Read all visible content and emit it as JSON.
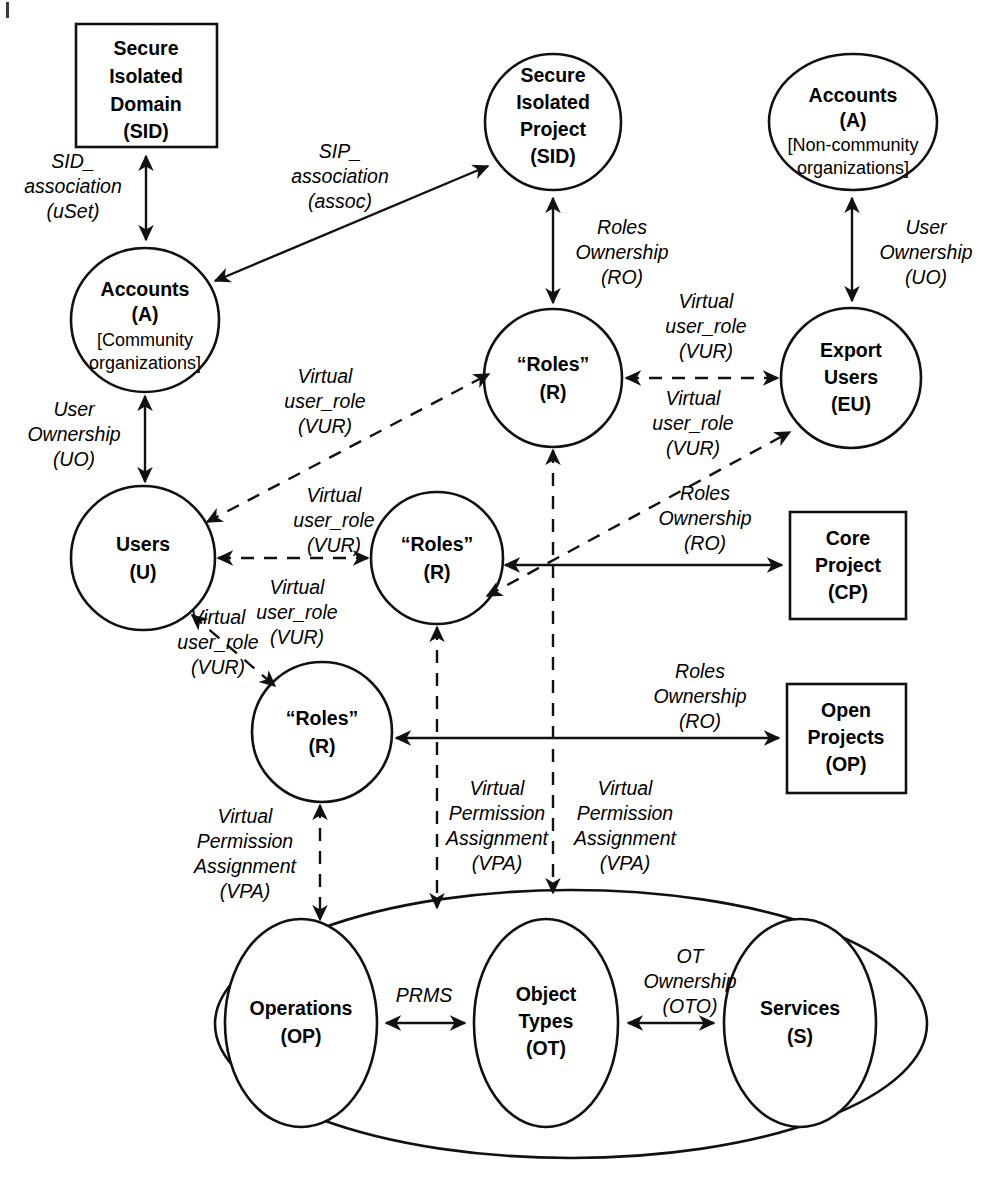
{
  "diagram": {
    "stroke_color": "#111111",
    "background_color": "#ffffff",
    "nodes": [
      {
        "id": "sid_box",
        "shape": "rect",
        "lines": [
          "Secure",
          "Isolated",
          "Domain",
          "(SID)"
        ]
      },
      {
        "id": "sip_circle",
        "shape": "circle",
        "lines": [
          "Secure",
          "Isolated",
          "Project",
          "(SID)"
        ]
      },
      {
        "id": "accounts_non",
        "shape": "ellipse",
        "lines": [
          "Accounts",
          "(A)"
        ],
        "sublines": [
          "[Non-community",
          "organizations]"
        ]
      },
      {
        "id": "accounts_comm",
        "shape": "ellipse",
        "lines": [
          "Accounts",
          "(A)"
        ],
        "sublines": [
          "[Community",
          "organizations]"
        ]
      },
      {
        "id": "roles_top",
        "shape": "circle",
        "lines": [
          "“Roles”",
          "(R)"
        ]
      },
      {
        "id": "export_users",
        "shape": "circle",
        "lines": [
          "Export",
          "Users",
          "(EU)"
        ]
      },
      {
        "id": "users",
        "shape": "circle",
        "lines": [
          "Users",
          "(U)"
        ]
      },
      {
        "id": "roles_mid",
        "shape": "circle",
        "lines": [
          "“Roles”",
          "(R)"
        ]
      },
      {
        "id": "core_project",
        "shape": "rect",
        "lines": [
          "Core",
          "Project",
          "(CP)"
        ]
      },
      {
        "id": "roles_bottom",
        "shape": "circle",
        "lines": [
          "“Roles”",
          "(R)"
        ]
      },
      {
        "id": "open_projects",
        "shape": "rect",
        "lines": [
          "Open",
          "Projects",
          "(OP)"
        ]
      },
      {
        "id": "operations",
        "shape": "ellipse",
        "lines": [
          "Operations",
          "(OP)"
        ]
      },
      {
        "id": "object_types",
        "shape": "ellipse",
        "lines": [
          "Object",
          "Types",
          "(OT)"
        ]
      },
      {
        "id": "services",
        "shape": "ellipse",
        "lines": [
          "Services",
          "(S)"
        ]
      },
      {
        "id": "outer_group",
        "shape": "ellipse",
        "lines": []
      }
    ],
    "edge_labels": [
      {
        "id": "sid_assoc",
        "lines": [
          "SID_",
          "association",
          "(uSet)"
        ]
      },
      {
        "id": "sip_assoc",
        "lines": [
          "SIP_",
          "association",
          "(assoc)"
        ]
      },
      {
        "id": "ro_sip",
        "lines": [
          "Roles",
          "Ownership",
          "(RO)"
        ]
      },
      {
        "id": "uo_non",
        "lines": [
          "User",
          "Ownership",
          "(UO)"
        ]
      },
      {
        "id": "vur_r_eu",
        "lines": [
          "Virtual",
          "user_role",
          "(VUR)"
        ]
      },
      {
        "id": "vur_u_rtop",
        "lines": [
          "Virtual",
          "user_role",
          "(VUR)"
        ]
      },
      {
        "id": "uo_comm",
        "lines": [
          "User",
          "Ownership",
          "(UO)"
        ]
      },
      {
        "id": "vur_rmid_eu",
        "lines": [
          "Virtual",
          "user_role",
          "(VUR)"
        ]
      },
      {
        "id": "vur_rmid_u",
        "lines": [
          "Virtual",
          "user_role",
          "(VUR)"
        ]
      },
      {
        "id": "vur_u_rmid",
        "lines": [
          "Virtual",
          "user_role",
          "(VUR)"
        ]
      },
      {
        "id": "ro_cp",
        "lines": [
          "Roles",
          "Ownership",
          "(RO)"
        ]
      },
      {
        "id": "vur_u_rbot",
        "lines": [
          "Virtual",
          "user_role",
          "(VUR)"
        ]
      },
      {
        "id": "ro_op",
        "lines": [
          "Roles",
          "Ownership",
          "(RO)"
        ]
      },
      {
        "id": "vpa_rbot",
        "lines": [
          "Virtual",
          "Permission",
          "Assignment",
          "(VPA)"
        ]
      },
      {
        "id": "vpa_mid",
        "lines": [
          "Virtual",
          "Permission",
          "Assignment",
          "(VPA)"
        ]
      },
      {
        "id": "vpa_right",
        "lines": [
          "Virtual",
          "Permission",
          "Assignment",
          "(VPA)"
        ]
      },
      {
        "id": "prms",
        "lines": [
          "PRMS"
        ]
      },
      {
        "id": "oto",
        "lines": [
          "OT",
          "Ownership",
          "(OTO)"
        ]
      }
    ]
  }
}
